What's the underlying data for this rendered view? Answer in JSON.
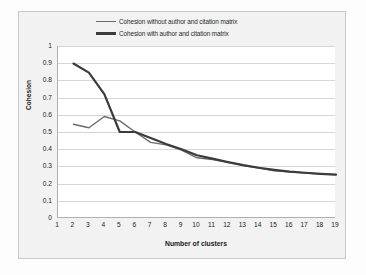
{
  "chart_data": {
    "type": "line",
    "title": "",
    "xlabel": "Number of clusters",
    "ylabel": "Cohesion",
    "x": [
      2,
      3,
      4,
      5,
      6,
      7,
      8,
      9,
      10,
      11,
      12,
      13,
      14,
      15,
      16,
      17,
      18,
      19
    ],
    "xlim": [
      1,
      19
    ],
    "ylim": [
      0,
      1
    ],
    "xticks": [
      1,
      2,
      3,
      4,
      5,
      6,
      7,
      8,
      9,
      10,
      11,
      12,
      13,
      14,
      15,
      16,
      17,
      18,
      19
    ],
    "yticks": [
      "0",
      "0.1",
      "0.2",
      "0.3",
      "0.4",
      "0.5",
      "0.6",
      "0.7",
      "0.8",
      "0.9",
      "1"
    ],
    "grid": true,
    "legend_position": "top",
    "series": [
      {
        "name": "Cohesion without author and citation matrix",
        "color": "#6b6b6b",
        "width": 1.4,
        "values": [
          0.545,
          0.525,
          0.59,
          0.565,
          0.5,
          0.44,
          0.425,
          0.395,
          0.35,
          0.34,
          0.325,
          0.305,
          0.29,
          0.275,
          0.268,
          0.262,
          0.256,
          0.252
        ]
      },
      {
        "name": "Cohesion with author and citation matrix",
        "color": "#3b3b3b",
        "width": 2.2,
        "values": [
          0.898,
          0.845,
          0.72,
          0.5,
          0.5,
          0.465,
          0.43,
          0.4,
          0.365,
          0.345,
          0.325,
          0.307,
          0.292,
          0.28,
          0.27,
          0.263,
          0.257,
          0.252
        ]
      }
    ]
  },
  "legend": {
    "items": [
      {
        "label": "Cohesion without author and citation matrix"
      },
      {
        "label": "Cohesion with author and citation matrix"
      }
    ]
  },
  "axes": {
    "y_title": "Cohesion",
    "x_title": "Number of clusters"
  },
  "colors": {
    "series_light": "#6b6b6b",
    "series_dark": "#3b3b3b",
    "plot_background": "#ffffff",
    "frame_background": "#f2f2f2",
    "gridline": "#d6d6d6",
    "axis_line": "#b0b0b0"
  }
}
